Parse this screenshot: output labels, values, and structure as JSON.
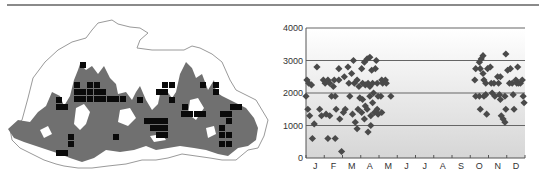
{
  "figure": {
    "left_panel": "Distribution map with occupied grid squares",
    "right_panel": "Elevation (m) of records by month"
  },
  "map": {
    "outline_color": "#9a9a9a",
    "forest_color": "#707070",
    "square_color": "#0a0a0a",
    "squares": [
      [
        80,
        62
      ],
      [
        74,
        82
      ],
      [
        87,
        82
      ],
      [
        94,
        82
      ],
      [
        74,
        89
      ],
      [
        80,
        89
      ],
      [
        87,
        89
      ],
      [
        94,
        89
      ],
      [
        100,
        89
      ],
      [
        74,
        96
      ],
      [
        80,
        96
      ],
      [
        87,
        96
      ],
      [
        94,
        96
      ],
      [
        100,
        96
      ],
      [
        107,
        96
      ],
      [
        113,
        96
      ],
      [
        120,
        96
      ],
      [
        56,
        97
      ],
      [
        56,
        104
      ],
      [
        62,
        104
      ],
      [
        137,
        97
      ],
      [
        162,
        82
      ],
      [
        169,
        82
      ],
      [
        156,
        89
      ],
      [
        162,
        89
      ],
      [
        169,
        97
      ],
      [
        200,
        82
      ],
      [
        213,
        82
      ],
      [
        213,
        89
      ],
      [
        182,
        104
      ],
      [
        181,
        111
      ],
      [
        187,
        111
      ],
      [
        194,
        111
      ],
      [
        200,
        111
      ],
      [
        144,
        118
      ],
      [
        150,
        118
      ],
      [
        156,
        118
      ],
      [
        162,
        118
      ],
      [
        150,
        125
      ],
      [
        156,
        125
      ],
      [
        162,
        125
      ],
      [
        156,
        132
      ],
      [
        162,
        132
      ],
      [
        230,
        104
      ],
      [
        236,
        104
      ],
      [
        226,
        111
      ],
      [
        219,
        125
      ],
      [
        220,
        111
      ],
      [
        226,
        118
      ],
      [
        219,
        132
      ],
      [
        226,
        132
      ],
      [
        219,
        141
      ],
      [
        226,
        141
      ],
      [
        68,
        134
      ],
      [
        68,
        141
      ],
      [
        56,
        150
      ],
      [
        62,
        150
      ],
      [
        113,
        134
      ]
    ]
  },
  "chart_data": {
    "type": "scatter",
    "title": "",
    "xlabel": "",
    "ylabel": "",
    "categories": [
      "J",
      "F",
      "M",
      "A",
      "M",
      "J",
      "J",
      "A",
      "S",
      "O",
      "N",
      "D"
    ],
    "yticks": [
      0,
      1000,
      2000,
      3000,
      4000
    ],
    "ylim": [
      0,
      4000
    ],
    "grid": {
      "horizontal": true,
      "at": [
        1000,
        2000,
        3000,
        4000
      ]
    },
    "legend": null,
    "background_gradient": [
      "#ffffff",
      "#d6d6d6"
    ],
    "marker": "diamond",
    "marker_color": "#4a4a4a",
    "points": [
      {
        "month": 1,
        "x": -0.45,
        "y": 2400
      },
      {
        "month": 1,
        "x": -0.35,
        "y": 2300
      },
      {
        "month": 1,
        "x": -0.2,
        "y": 2250
      },
      {
        "month": 1,
        "x": -0.5,
        "y": 1900
      },
      {
        "month": 1,
        "x": -0.4,
        "y": 1500
      },
      {
        "month": 1,
        "x": -0.3,
        "y": 1300
      },
      {
        "month": 1,
        "x": -0.05,
        "y": 1050
      },
      {
        "month": 1,
        "x": -0.15,
        "y": 600
      },
      {
        "month": 1,
        "x": 0.1,
        "y": 2800
      },
      {
        "month": 1,
        "x": 0.25,
        "y": 1500
      },
      {
        "month": 1,
        "x": 0.35,
        "y": 1300
      },
      {
        "month": 1,
        "x": 0.45,
        "y": 2400
      },
      {
        "month": 2,
        "x": -0.45,
        "y": 2300
      },
      {
        "month": 2,
        "x": -0.3,
        "y": 2400
      },
      {
        "month": 2,
        "x": -0.2,
        "y": 2300
      },
      {
        "month": 2,
        "x": -0.1,
        "y": 1900
      },
      {
        "month": 2,
        "x": -0.4,
        "y": 1350
      },
      {
        "month": 2,
        "x": -0.2,
        "y": 1300
      },
      {
        "month": 2,
        "x": -0.3,
        "y": 600
      },
      {
        "month": 2,
        "x": 0.1,
        "y": 600
      },
      {
        "month": 2,
        "x": 0.05,
        "y": 2400
      },
      {
        "month": 2,
        "x": 0.0,
        "y": 2200
      },
      {
        "month": 2,
        "x": 0.1,
        "y": 1900
      },
      {
        "month": 2,
        "x": 0.15,
        "y": 1500
      },
      {
        "month": 2,
        "x": 0.3,
        "y": 2750
      },
      {
        "month": 2,
        "x": 0.3,
        "y": 2400
      },
      {
        "month": 2,
        "x": 0.35,
        "y": 1200
      },
      {
        "month": 2,
        "x": 0.45,
        "y": 200
      },
      {
        "month": 3,
        "x": -0.4,
        "y": 2500
      },
      {
        "month": 3,
        "x": -0.35,
        "y": 1500
      },
      {
        "month": 3,
        "x": -0.45,
        "y": 1400
      },
      {
        "month": 3,
        "x": -0.2,
        "y": 2800
      },
      {
        "month": 3,
        "x": -0.15,
        "y": 2300
      },
      {
        "month": 3,
        "x": -0.1,
        "y": 1900
      },
      {
        "month": 3,
        "x": 0.0,
        "y": 2600
      },
      {
        "month": 3,
        "x": 0.1,
        "y": 3000
      },
      {
        "month": 3,
        "x": 0.15,
        "y": 2300
      },
      {
        "month": 3,
        "x": 0.05,
        "y": 1350
      },
      {
        "month": 3,
        "x": 0.2,
        "y": 1100
      },
      {
        "month": 3,
        "x": 0.3,
        "y": 900
      },
      {
        "month": 3,
        "x": 0.3,
        "y": 2400
      },
      {
        "month": 3,
        "x": 0.4,
        "y": 2200
      },
      {
        "month": 3,
        "x": 0.45,
        "y": 1850
      },
      {
        "month": 3,
        "x": 0.35,
        "y": 1500
      },
      {
        "month": 4,
        "x": -0.45,
        "y": 2750
      },
      {
        "month": 4,
        "x": -0.4,
        "y": 2300
      },
      {
        "month": 4,
        "x": -0.4,
        "y": 1800
      },
      {
        "month": 4,
        "x": -0.45,
        "y": 1400
      },
      {
        "month": 4,
        "x": -0.3,
        "y": 2950
      },
      {
        "month": 4,
        "x": -0.25,
        "y": 2250
      },
      {
        "month": 4,
        "x": -0.25,
        "y": 1600
      },
      {
        "month": 4,
        "x": -0.3,
        "y": 1200
      },
      {
        "month": 4,
        "x": -0.15,
        "y": 3050
      },
      {
        "month": 4,
        "x": -0.1,
        "y": 2300
      },
      {
        "month": 4,
        "x": -0.15,
        "y": 1500
      },
      {
        "month": 4,
        "x": -0.1,
        "y": 800
      },
      {
        "month": 4,
        "x": 0.0,
        "y": 3100
      },
      {
        "month": 4,
        "x": 0.0,
        "y": 2200
      },
      {
        "month": 4,
        "x": 0.0,
        "y": 1900
      },
      {
        "month": 4,
        "x": 0.05,
        "y": 1300
      },
      {
        "month": 4,
        "x": 0.05,
        "y": 1000
      },
      {
        "month": 4,
        "x": 0.1,
        "y": 2700
      },
      {
        "month": 4,
        "x": 0.15,
        "y": 2300
      },
      {
        "month": 4,
        "x": 0.15,
        "y": 1700
      },
      {
        "month": 4,
        "x": 0.2,
        "y": 2000
      },
      {
        "month": 4,
        "x": 0.25,
        "y": 1400
      },
      {
        "month": 4,
        "x": 0.3,
        "y": 2750
      },
      {
        "month": 4,
        "x": 0.35,
        "y": 3000
      },
      {
        "month": 4,
        "x": 0.4,
        "y": 2300
      },
      {
        "month": 4,
        "x": 0.45,
        "y": 1900
      },
      {
        "month": 4,
        "x": 0.4,
        "y": 1500
      },
      {
        "month": 4,
        "x": 0.45,
        "y": 1350
      },
      {
        "month": 5,
        "x": -0.35,
        "y": 2400
      },
      {
        "month": 5,
        "x": -0.3,
        "y": 2300
      },
      {
        "month": 5,
        "x": -0.4,
        "y": 1900
      },
      {
        "month": 5,
        "x": -0.35,
        "y": 1400
      },
      {
        "month": 5,
        "x": -0.15,
        "y": 2400
      },
      {
        "month": 5,
        "x": -0.1,
        "y": 2300
      },
      {
        "month": 5,
        "x": 0.15,
        "y": 1900
      },
      {
        "month": 10,
        "x": -0.2,
        "y": 2750
      },
      {
        "month": 10,
        "x": -0.25,
        "y": 2400
      },
      {
        "month": 10,
        "x": -0.2,
        "y": 1900
      },
      {
        "month": 10,
        "x": 0.0,
        "y": 2950
      },
      {
        "month": 10,
        "x": 0.05,
        "y": 2750
      },
      {
        "month": 10,
        "x": 0.0,
        "y": 1900
      },
      {
        "month": 10,
        "x": 0.05,
        "y": 1500
      },
      {
        "month": 10,
        "x": 0.1,
        "y": 3050
      },
      {
        "month": 10,
        "x": 0.2,
        "y": 3150
      },
      {
        "month": 10,
        "x": 0.2,
        "y": 2600
      },
      {
        "month": 10,
        "x": 0.25,
        "y": 2400
      },
      {
        "month": 10,
        "x": 0.25,
        "y": 1900
      },
      {
        "month": 10,
        "x": 0.35,
        "y": 2300
      },
      {
        "month": 10,
        "x": 0.35,
        "y": 1950
      },
      {
        "month": 10,
        "x": 0.4,
        "y": 1350
      },
      {
        "month": 10,
        "x": 0.45,
        "y": 2750
      },
      {
        "month": 11,
        "x": -0.4,
        "y": 2800
      },
      {
        "month": 11,
        "x": -0.35,
        "y": 2300
      },
      {
        "month": 11,
        "x": -0.3,
        "y": 2000
      },
      {
        "month": 11,
        "x": -0.2,
        "y": 2300
      },
      {
        "month": 11,
        "x": -0.15,
        "y": 1900
      },
      {
        "month": 11,
        "x": 0.0,
        "y": 2500
      },
      {
        "month": 11,
        "x": 0.05,
        "y": 2300
      },
      {
        "month": 11,
        "x": 0.15,
        "y": 2500
      },
      {
        "month": 11,
        "x": 0.1,
        "y": 1950
      },
      {
        "month": 11,
        "x": 0.15,
        "y": 1800
      },
      {
        "month": 11,
        "x": 0.2,
        "y": 1300
      },
      {
        "month": 11,
        "x": 0.3,
        "y": 1200
      },
      {
        "month": 11,
        "x": 0.4,
        "y": 1900
      },
      {
        "month": 11,
        "x": 0.4,
        "y": 1100
      },
      {
        "month": 11,
        "x": 0.45,
        "y": 1500
      },
      {
        "month": 11,
        "x": 0.45,
        "y": 3200
      },
      {
        "month": 12,
        "x": -0.45,
        "y": 2700
      },
      {
        "month": 12,
        "x": -0.35,
        "y": 2300
      },
      {
        "month": 12,
        "x": -0.3,
        "y": 2750
      },
      {
        "month": 12,
        "x": -0.2,
        "y": 2300
      },
      {
        "month": 12,
        "x": -0.15,
        "y": 1950
      },
      {
        "month": 12,
        "x": -0.1,
        "y": 1500
      },
      {
        "month": 12,
        "x": 0.0,
        "y": 2400
      },
      {
        "month": 12,
        "x": 0.05,
        "y": 2300
      },
      {
        "month": 12,
        "x": 0.1,
        "y": 2800
      },
      {
        "month": 12,
        "x": 0.15,
        "y": 2300
      },
      {
        "month": 12,
        "x": 0.25,
        "y": 2300
      },
      {
        "month": 12,
        "x": 0.35,
        "y": 2400
      },
      {
        "month": 12,
        "x": 0.4,
        "y": 1900
      },
      {
        "month": 12,
        "x": 0.45,
        "y": 1700
      }
    ]
  }
}
